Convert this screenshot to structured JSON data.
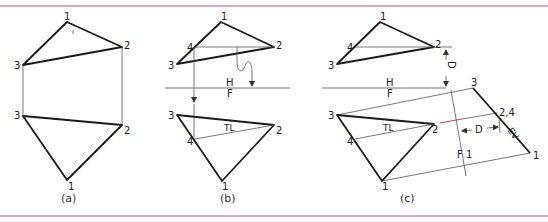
{
  "figure": {
    "panels": [
      {
        "id": "a",
        "caption": "(a)",
        "top_view": {
          "points": [
            {
              "label": "1"
            },
            {
              "label": "2"
            },
            {
              "label": "3"
            }
          ]
        },
        "front_view": {
          "points": [
            {
              "label": "3"
            },
            {
              "label": "2"
            },
            {
              "label": "1"
            }
          ]
        }
      },
      {
        "id": "b",
        "caption": "(b)",
        "top_view": {
          "points": [
            {
              "label": "1"
            },
            {
              "label": "2"
            },
            {
              "label": "3"
            },
            {
              "label": "4"
            }
          ]
        },
        "fold_line": {
          "upper": "H",
          "lower": "F"
        },
        "front_view": {
          "points": [
            {
              "label": "3"
            },
            {
              "label": "2"
            },
            {
              "label": "4"
            },
            {
              "label": "1"
            }
          ],
          "true_length_label": "TL"
        }
      },
      {
        "id": "c",
        "caption": "(c)",
        "top_view": {
          "points": [
            {
              "label": "1"
            },
            {
              "label": "2"
            },
            {
              "label": "3"
            },
            {
              "label": "4"
            }
          ],
          "distance_label": "D"
        },
        "fold_line": {
          "upper": "H",
          "lower": "F"
        },
        "front_view": {
          "points": [
            {
              "label": "3"
            },
            {
              "label": "2"
            },
            {
              "label": "4"
            },
            {
              "label": "1"
            }
          ],
          "true_length_label": "TL"
        },
        "aux_fold_line": {
          "left": "F",
          "right": "1"
        },
        "aux_view": {
          "points": [
            {
              "label": "3"
            },
            {
              "label": "2,4"
            },
            {
              "label": "1"
            }
          ],
          "edge_view_label": "EV",
          "distance_label": "D"
        }
      }
    ]
  },
  "colors": {
    "rule": "#d9aab8",
    "line": "#1a1a1a",
    "projection": "#555555",
    "accent": "#d23a5a"
  }
}
